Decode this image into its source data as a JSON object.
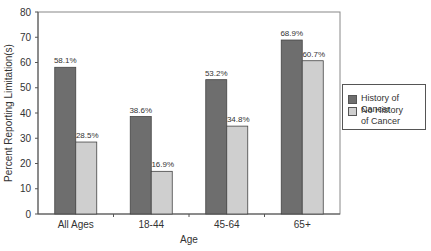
{
  "chart_data": {
    "type": "bar",
    "title": "",
    "xlabel": "Age",
    "ylabel": "Percent Reporting Limitation(s)",
    "ylim": [
      0,
      80
    ],
    "yticks": [
      0,
      10,
      20,
      30,
      40,
      50,
      60,
      70,
      80
    ],
    "categories": [
      "All Ages",
      "18-44",
      "45-64",
      "65+"
    ],
    "series": [
      {
        "name": "History of Cancer",
        "color": "#6e6e6e",
        "values": [
          58.1,
          38.6,
          53.2,
          68.9
        ],
        "labels": [
          "58.1%",
          "38.6%",
          "53.2%",
          "68.9%"
        ]
      },
      {
        "name": "No History of Cancer",
        "color": "#cfcfcf",
        "values": [
          28.5,
          16.9,
          34.8,
          60.7
        ],
        "labels": [
          "28.5%",
          "16.9%",
          "34.8%",
          "60.7%"
        ]
      }
    ],
    "grid": false,
    "legend_position": "right"
  },
  "legend": {
    "items": [
      {
        "label_line1": "History of Cancer",
        "label_line2": "",
        "color": "#6e6e6e"
      },
      {
        "label_line1": "No History",
        "label_line2": "of Cancer",
        "color": "#cfcfcf"
      }
    ]
  }
}
